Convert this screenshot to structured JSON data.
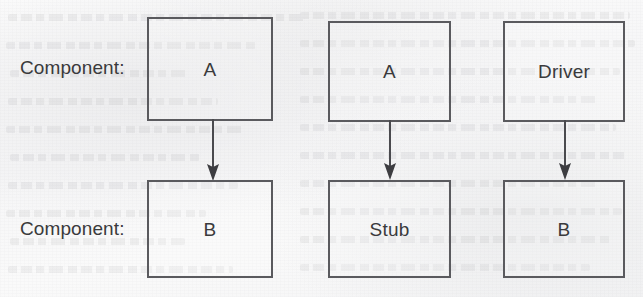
{
  "page": {
    "kind": "scanned-textbook-figure",
    "background_color": "#fbfbfb",
    "ink_color": "#3a3a3c",
    "line_color": "#5a5a5e"
  },
  "diagram": {
    "type": "block-diagram",
    "row_labels": [
      {
        "id": "row-top",
        "text": "Component:"
      },
      {
        "id": "row-bottom",
        "text": "Component:"
      }
    ],
    "columns": [
      {
        "id": "column-1",
        "top_box": {
          "label": "A"
        },
        "bottom_box": {
          "label": "B"
        },
        "connector": {
          "kind": "arrow-down"
        }
      },
      {
        "id": "column-2",
        "top_box": {
          "label": "A"
        },
        "bottom_box": {
          "label": "Stub"
        },
        "connector": {
          "kind": "arrow-down"
        }
      },
      {
        "id": "column-3",
        "top_box": {
          "label": "Driver"
        },
        "bottom_box": {
          "label": "B"
        },
        "connector": {
          "kind": "arrow-down"
        }
      }
    ]
  }
}
